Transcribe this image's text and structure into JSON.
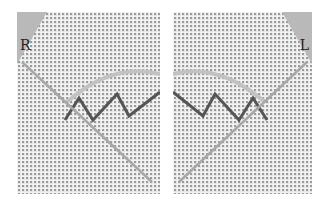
{
  "image": {
    "description": "Two side-by-side photos of embroidery on even-weave canvas showing a zigzag stitch with a needle, mirrored for right- and left-handed stitching",
    "panels": [
      {
        "id": "left",
        "label": "R"
      },
      {
        "id": "right",
        "label": "L"
      }
    ],
    "colors": {
      "fabric": "#e4e4e4",
      "thread": "#555555",
      "needle": "#a8a8a8",
      "corner": "#b9b9b9"
    }
  }
}
